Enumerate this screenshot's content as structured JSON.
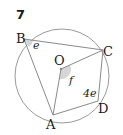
{
  "question_number": "7",
  "points": {
    "A": "A",
    "B": "B",
    "C": "C",
    "D": "D",
    "O": "O"
  },
  "angles": {
    "at_B": "e",
    "at_O": "f",
    "at_D": "4e"
  },
  "colors": {
    "line": "#8a8a8a",
    "circle": "#9a9a9a",
    "shade": "#d6d6d6",
    "text": "#1a1a1a"
  }
}
